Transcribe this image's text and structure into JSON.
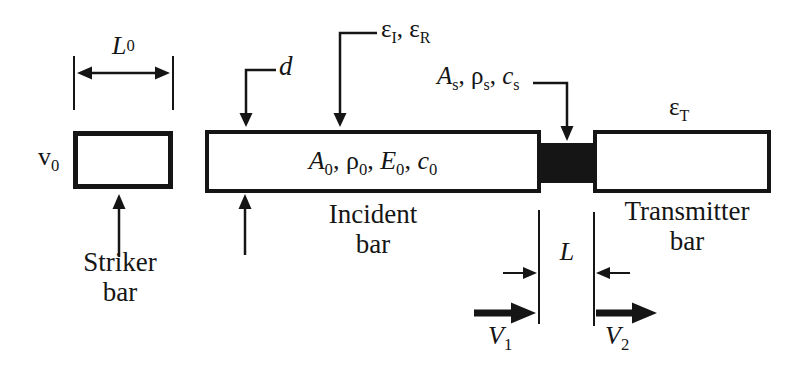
{
  "figure": {
    "type": "split-hopkinson-pressure-bar-schematic",
    "background": "#ffffff",
    "ink": "#151515"
  },
  "striker": {
    "velocity_label": [
      {
        "t": "v"
      },
      {
        "t": "0",
        "sub": true
      }
    ],
    "length_label": [
      {
        "t": "L",
        "i": true
      },
      {
        "t": "0",
        "sub": true
      }
    ],
    "caption_line1": "Striker",
    "caption_line2": "bar"
  },
  "incident": {
    "properties_label": [
      {
        "t": "A",
        "i": true
      },
      {
        "t": "0",
        "sub": true
      },
      {
        "t": ", "
      },
      {
        "t": "ρ"
      },
      {
        "t": "0",
        "sub": true
      },
      {
        "t": ", "
      },
      {
        "t": "E",
        "i": true
      },
      {
        "t": "0",
        "sub": true
      },
      {
        "t": ", "
      },
      {
        "t": "c",
        "i": true
      },
      {
        "t": "0",
        "sub": true
      }
    ],
    "diameter_label": [
      {
        "t": "d",
        "i": true
      }
    ],
    "strain_gauge_label": [
      {
        "t": "ε"
      },
      {
        "t": "I",
        "sub": true
      },
      {
        "t": ", "
      },
      {
        "t": "ε"
      },
      {
        "t": "R",
        "sub": true
      }
    ],
    "caption_line1": "Incident",
    "caption_line2": "bar"
  },
  "specimen": {
    "properties_label": [
      {
        "t": "A",
        "i": true
      },
      {
        "t": "s",
        "sub": true
      },
      {
        "t": ", "
      },
      {
        "t": "ρ"
      },
      {
        "t": "s",
        "sub": true
      },
      {
        "t": ", "
      },
      {
        "t": "c",
        "i": true
      },
      {
        "t": "s",
        "sub": true
      }
    ],
    "length_label": [
      {
        "t": "L",
        "i": true
      }
    ],
    "face_velocity_1_label": [
      {
        "t": "V",
        "i": true
      },
      {
        "t": "1",
        "sub": true
      }
    ],
    "face_velocity_2_label": [
      {
        "t": "V",
        "i": true
      },
      {
        "t": "2",
        "sub": true
      }
    ]
  },
  "transmitter": {
    "strain_gauge_label": [
      {
        "t": "ε"
      },
      {
        "t": "T",
        "sub": true
      }
    ],
    "caption_line1": "Transmitter",
    "caption_line2": "bar"
  }
}
